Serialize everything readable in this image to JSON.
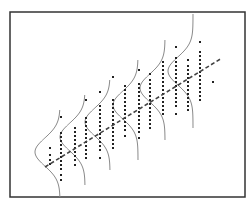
{
  "diagram": {
    "title": "",
    "colors": {
      "background": "#ffffff",
      "frame": "#333333",
      "curve": "#8a8a8a",
      "regression_line": "#444444",
      "points": "#222222"
    },
    "frame": {
      "x": 10,
      "y": 12,
      "width": 235,
      "height": 185
    },
    "regression_line": {
      "x1": 45,
      "y1": 167,
      "x2": 222,
      "y2": 58,
      "style": "dashed"
    },
    "distributions": [
      {
        "baseline_x": 60,
        "center_y": 152,
        "amplitude": 25,
        "sigma": 14,
        "top": 110,
        "bottom": 197
      },
      {
        "baseline_x": 85,
        "center_y": 137,
        "amplitude": 25,
        "sigma": 14,
        "top": 95,
        "bottom": 185
      },
      {
        "baseline_x": 110,
        "center_y": 122,
        "amplitude": 25,
        "sigma": 14,
        "top": 80,
        "bottom": 170
      },
      {
        "baseline_x": 138,
        "center_y": 105,
        "amplitude": 25,
        "sigma": 14,
        "top": 60,
        "bottom": 160
      },
      {
        "baseline_x": 165,
        "center_y": 88,
        "amplitude": 25,
        "sigma": 14,
        "top": 40,
        "bottom": 140
      },
      {
        "baseline_x": 193,
        "center_y": 71,
        "amplitude": 25,
        "sigma": 14,
        "top": 14,
        "bottom": 128
      }
    ],
    "point_columns": [
      {
        "x": 50,
        "ys": [
          148,
          155,
          160,
          164
        ]
      },
      {
        "x": 61,
        "ys": [
          117,
          133,
          137,
          141,
          145,
          149,
          153,
          157,
          161,
          165,
          169,
          175,
          180
        ]
      },
      {
        "x": 75,
        "ys": [
          128,
          132,
          136,
          140,
          144,
          148,
          152,
          156,
          160,
          165
        ]
      },
      {
        "x": 86,
        "ys": [
          100,
          118,
          122,
          126,
          130,
          134,
          138,
          142,
          146,
          150,
          154,
          158
        ]
      },
      {
        "x": 100,
        "ys": [
          92,
          106,
          110,
          114,
          118,
          122,
          126,
          130,
          134,
          138,
          142,
          146,
          150,
          158
        ]
      },
      {
        "x": 113,
        "ys": [
          77,
          100,
          104,
          108,
          112,
          116,
          120,
          124,
          128,
          132,
          136,
          140,
          144,
          148
        ]
      },
      {
        "x": 125,
        "ys": [
          86,
          90,
          94,
          98,
          102,
          106,
          110,
          114,
          118,
          122,
          126,
          130,
          136
        ]
      },
      {
        "x": 139,
        "ys": [
          70,
          84,
          88,
          92,
          96,
          100,
          104,
          108,
          112,
          116,
          120,
          124,
          128,
          132,
          138
        ]
      },
      {
        "x": 150,
        "ys": [
          74,
          80,
          84,
          88,
          92,
          96,
          100,
          104,
          108,
          112,
          116,
          120,
          124,
          128
        ]
      },
      {
        "x": 163,
        "ys": [
          62,
          66,
          70,
          74,
          78,
          82,
          86,
          90,
          94,
          98,
          102,
          106,
          110,
          114
        ]
      },
      {
        "x": 176,
        "ys": [
          47,
          58,
          62,
          66,
          70,
          74,
          78,
          82,
          86,
          90,
          94,
          98,
          102,
          106,
          114
        ]
      },
      {
        "x": 188,
        "ys": [
          60,
          66,
          70,
          74,
          78,
          82,
          86,
          90,
          94,
          98,
          102,
          106,
          110
        ]
      },
      {
        "x": 200,
        "ys": [
          42,
          52,
          56,
          60,
          64,
          68,
          72,
          76,
          80,
          84,
          88,
          92,
          96,
          100
        ]
      },
      {
        "x": 213,
        "ys": [
          82
        ]
      }
    ]
  }
}
